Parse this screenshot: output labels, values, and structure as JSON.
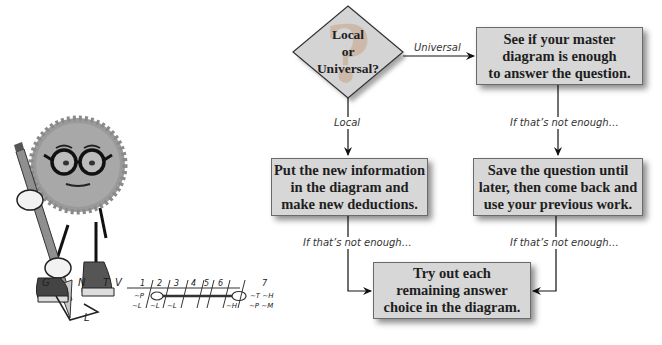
{
  "flowchart": {
    "decision": {
      "lines": [
        "Local",
        "or",
        "Universal?"
      ]
    },
    "edges": {
      "universal_label": "Universal",
      "local_label": "Local",
      "not_enough_right_top": "If that’s not enough…",
      "not_enough_left_bottom": "If that’s not enough…",
      "not_enough_right_bottom": "If that’s not enough…"
    },
    "boxes": {
      "master_diagram": {
        "lines": [
          "See if your master",
          "diagram is enough",
          "to answer the question."
        ]
      },
      "new_information": {
        "lines": [
          "Put the new information",
          "in the diagram and",
          "make new deductions."
        ]
      },
      "save_question": {
        "lines": [
          "Save the question until",
          "later, then come back and",
          "use your previous work."
        ]
      },
      "try_out": {
        "lines": [
          "Try out each",
          "remaining answer",
          "choice in the diagram."
        ]
      }
    }
  },
  "illustration": {
    "description": "cartoon-character-with-pencil",
    "letters": [
      "G",
      "N",
      "T",
      "V"
    ],
    "corner_label": "L",
    "grid": {
      "columns": [
        "1",
        "2",
        "3",
        "4",
        "5",
        "6",
        "7"
      ],
      "row1": [
        "~P",
        "",
        "",
        "",
        "",
        "",
        "~T ~H"
      ],
      "row2": [
        "~L",
        "~L",
        "~L",
        "",
        "",
        "~H",
        "~P ~M"
      ]
    }
  }
}
